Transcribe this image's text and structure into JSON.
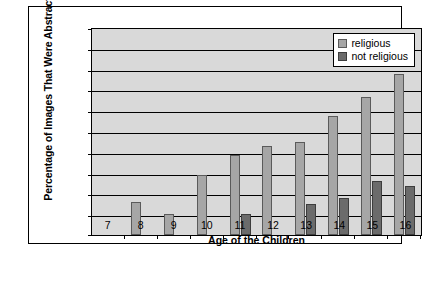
{
  "chart_data": {
    "type": "bar",
    "title": "",
    "xlabel": "Age of the Children",
    "ylabel": "Percentage of Images That Were Abstract",
    "categories": [
      "7",
      "8",
      "9",
      "10",
      "11",
      "12",
      "13",
      "14",
      "15",
      "16"
    ],
    "yticks": [
      "100",
      "90",
      "80",
      "70",
      "60",
      "50",
      "40",
      "30",
      "20",
      "10",
      "0"
    ],
    "ylim": [
      0,
      100
    ],
    "grid": true,
    "legend_position": "top-right-inside",
    "series": [
      {
        "name": "religious",
        "color": "#a6a6a6",
        "values": [
          0,
          16,
          10,
          29,
          39,
          43,
          45,
          58,
          67,
          78
        ]
      },
      {
        "name": "not religious",
        "color": "#6b6b6b",
        "values": [
          0,
          0,
          0,
          0,
          10,
          0,
          15,
          18,
          26,
          24
        ]
      }
    ]
  },
  "legend": {
    "items": [
      {
        "label": "religious"
      },
      {
        "label": "not religious"
      }
    ]
  }
}
